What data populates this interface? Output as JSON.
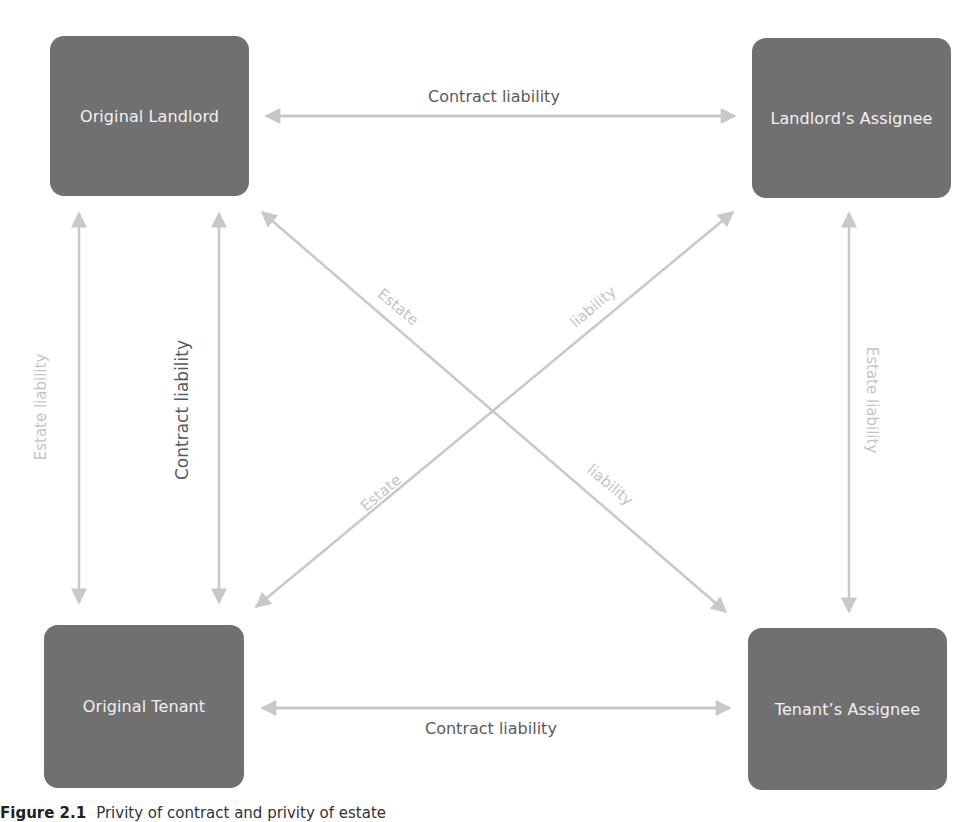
{
  "nodes": {
    "original_landlord": "Original Landlord",
    "landlords_assignee": "Landlord’s Assignee",
    "original_tenant": "Original Tenant",
    "tenants_assignee": "Tenant’s Assignee"
  },
  "edges": {
    "top_horizontal": "Contract liability",
    "bottom_horizontal": "Contract liability",
    "left_outer_vertical": "Estate liability",
    "left_inner_vertical": "Contract liability",
    "right_vertical": "Estate liability",
    "diag_down_upper": "Estate",
    "diag_down_lower": "liability",
    "diag_up_upper": "liability",
    "diag_up_lower": "Estate"
  },
  "caption": {
    "figure_number": "Figure 2.1",
    "text": "Privity of contract and privity of estate"
  },
  "colors": {
    "node_fill": "#707070",
    "node_text": "#f2f2f2",
    "arrow": "#c8c8c8",
    "dark_label": "#5a5a5a",
    "light_label": "#c4c4c4"
  }
}
